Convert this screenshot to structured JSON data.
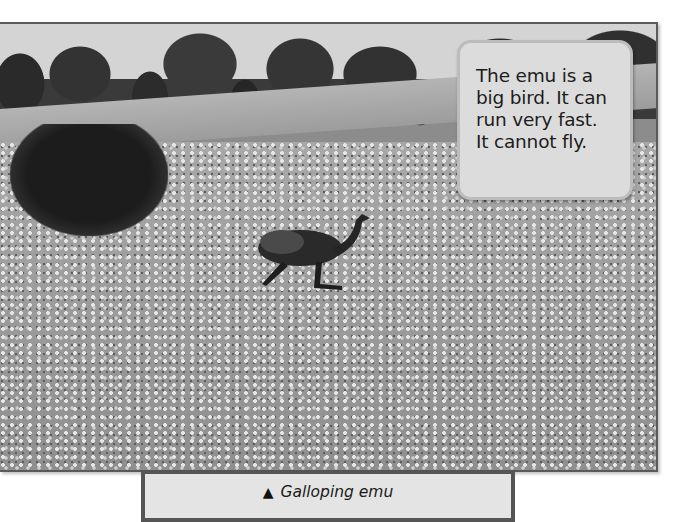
{
  "photo": {
    "subject": "emu running through a field of white flowers",
    "alt": "Galloping emu"
  },
  "info_card": {
    "lines": [
      "The emu is a",
      "big bird. It can",
      "run very fast.",
      "It cannot fly."
    ]
  },
  "caption": {
    "icon": "▲",
    "text": "Galloping emu"
  },
  "colors": {
    "photo_border": "#5a5a5a",
    "card_fill": "#dcdcdc",
    "card_border": "#bcbcbc",
    "caption_fill": "#e4e4e4",
    "caption_border": "#555555"
  }
}
